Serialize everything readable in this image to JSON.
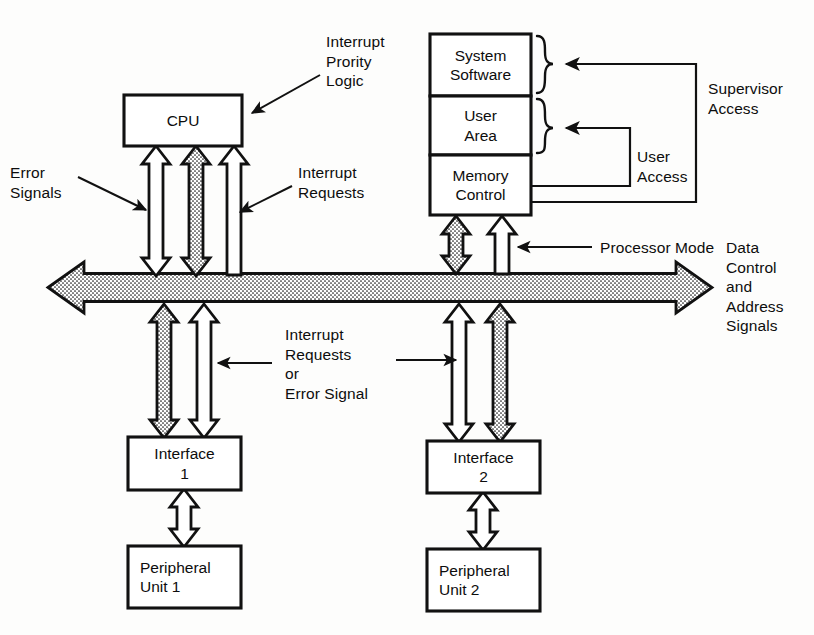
{
  "diagram": {
    "colors": {
      "ink": "#111111",
      "paper": "#fdfdfc",
      "box_fill": "#ffffff"
    },
    "boxes": {
      "cpu": "CPU",
      "system_software": "System\nSoftware",
      "user_area": "User\nArea",
      "memory_control": "Memory\nControl",
      "interface_1": "Interface\n1",
      "interface_2": "Interface\n2",
      "peripheral_1": "Peripheral\nUnit 1",
      "peripheral_2": "Peripheral\nUnit 2"
    },
    "labels": {
      "interrupt_priority_logic": "Interrupt\nPrority\nLogic",
      "error_signals": "Error\nSignals",
      "interrupt_requests": "Interrupt\nRequests",
      "interrupt_requests_or_error_signal": "Interrupt\nRequests\nor\nError Signal",
      "supervisor_access": "Supervisor\nAccess",
      "user_access": "User\nAccess",
      "processor_mode": "Processor Mode",
      "bus_signals": "Data\nControl\nand\nAddress\nSignals"
    },
    "bus": {
      "name": "system-bus",
      "direction": "bidirectional",
      "fill": "stippled"
    },
    "connectors": [
      {
        "name": "error-signals-channel",
        "style": "hollow",
        "from": "bus",
        "to": "cpu",
        "heads": "both"
      },
      {
        "name": "cpu-bus-data-channel",
        "style": "stippled",
        "from": "bus",
        "to": "cpu",
        "heads": "both"
      },
      {
        "name": "interrupt-requests-channel",
        "style": "hollow",
        "from": "bus",
        "to": "cpu",
        "heads": "top"
      },
      {
        "name": "memory-bus-data-channel",
        "style": "stippled",
        "from": "bus",
        "to": "memory_control",
        "heads": "both"
      },
      {
        "name": "processor-mode-channel",
        "style": "hollow",
        "from": "bus",
        "to": "memory_control",
        "heads": "top"
      },
      {
        "name": "interface1-data-channel",
        "style": "stippled",
        "from": "interface_1",
        "to": "bus",
        "heads": "both"
      },
      {
        "name": "interface1-interrupt-channel",
        "style": "hollow",
        "from": "interface_1",
        "to": "bus",
        "heads": "both"
      },
      {
        "name": "interface2-interrupt-channel",
        "style": "hollow",
        "from": "interface_2",
        "to": "bus",
        "heads": "both"
      },
      {
        "name": "interface2-data-channel",
        "style": "stippled",
        "from": "interface_2",
        "to": "bus",
        "heads": "both"
      },
      {
        "name": "interface1-peripheral1-channel",
        "style": "hollow",
        "from": "interface_1",
        "to": "peripheral_1",
        "heads": "both"
      },
      {
        "name": "interface2-peripheral2-channel",
        "style": "hollow",
        "from": "interface_2",
        "to": "peripheral_2",
        "heads": "both"
      }
    ]
  }
}
